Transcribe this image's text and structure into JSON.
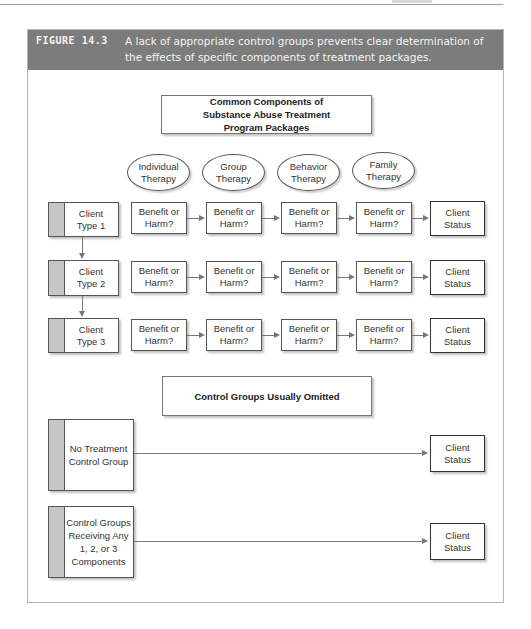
{
  "figure": {
    "label": "FIGURE 14.3",
    "caption": "A lack of appropriate control groups prevents clear determination of the effects of specific components of treatment packages."
  },
  "diagram": {
    "treatment_title": "Common Components of Substance Abuse Treatment Program Packages",
    "components": [
      {
        "label": "Individual Therapy"
      },
      {
        "label": "Group Therapy"
      },
      {
        "label": "Behavior Therapy"
      },
      {
        "label": "Family Therapy"
      }
    ],
    "client_rows": [
      {
        "client": "Client Type 1",
        "steps": [
          "Benefit or Harm?",
          "Benefit or Harm?",
          "Benefit or Harm?",
          "Benefit or Harm?"
        ],
        "outcome": "Client Status"
      },
      {
        "client": "Client Type 2",
        "steps": [
          "Benefit or Harm?",
          "Benefit or Harm?",
          "Benefit or Harm?",
          "Benefit or Harm?"
        ],
        "outcome": "Client Status"
      },
      {
        "client": "Client Type 3",
        "steps": [
          "Benefit or Harm?",
          "Benefit or Harm?",
          "Benefit or Harm?",
          "Benefit or Harm?"
        ],
        "outcome": "Client Status"
      }
    ],
    "control_title": "Control Groups Usually Omitted",
    "control_rows": [
      {
        "group": "No Treatment Control Group",
        "outcome": "Client Status"
      },
      {
        "group": "Control Groups Receiving Any 1, 2, or 3 Components",
        "outcome": "Client Status"
      }
    ]
  },
  "colors": {
    "header_bg": "#7c7c7c",
    "header_text": "#f4f4f4",
    "strip": "#c6c6c6",
    "line": "#777777"
  }
}
